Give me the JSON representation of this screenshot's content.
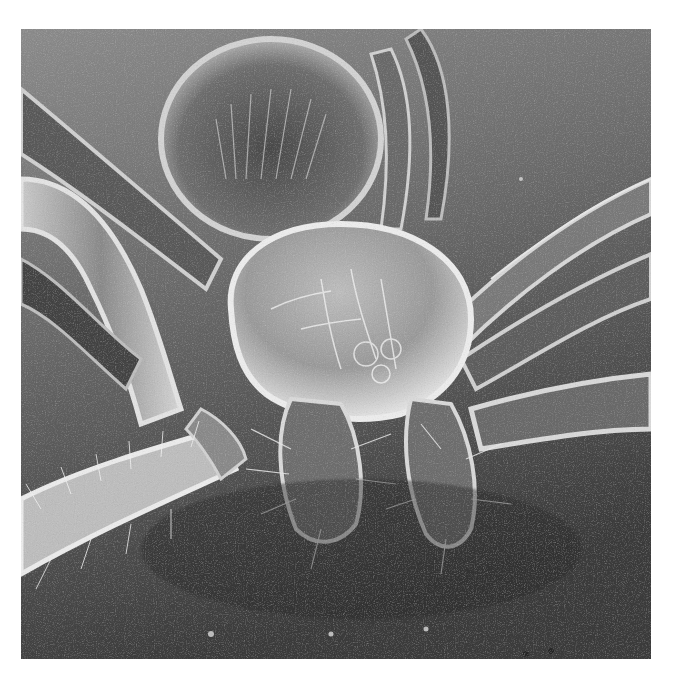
{
  "image": {
    "subject": "Scanning electron micrograph of a spider, frontal view",
    "style": "grayscale SEM",
    "colors": {
      "page_background": "#ffffff",
      "substrate_light": "#8a8a8a",
      "substrate_dark": "#3a3a3a",
      "body_highlight": "#d8d8d8",
      "body_mid": "#9a9a9a",
      "shadow": "#2a2a2a"
    },
    "regions": {
      "abdomen": "upper center, hairy dome behind cephalothorax",
      "cephalothorax": "center, smooth dome with fine setae",
      "chelicerae": "lower center, two hairy appendages",
      "legs_left": "multiple bristled legs extending to left edge",
      "legs_right": "multiple bristled legs extending to right edge",
      "substrate": "grainy gray surface, darker toward bottom"
    }
  }
}
